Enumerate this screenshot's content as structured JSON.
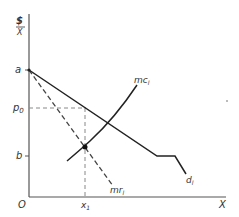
{
  "diagram": {
    "type": "economics-monopoly-pricing",
    "y_axis_label_top": "$",
    "y_axis_label_bottom": "X",
    "x_axis_label": "X",
    "origin_label": "O",
    "y_ticks": [
      {
        "label": "a",
        "y": 70
      },
      {
        "label": "p",
        "sub": "0",
        "y": 108
      },
      {
        "label": "b",
        "y": 156
      }
    ],
    "x_ticks": [
      {
        "label": "x",
        "sub": "1",
        "x": 85
      }
    ],
    "curves": [
      {
        "name": "demand",
        "label": "d",
        "sub": "l",
        "style": "solid"
      },
      {
        "name": "marginal-cost",
        "label": "mc",
        "sub": "l",
        "style": "solid"
      },
      {
        "name": "marginal-revenue",
        "label": "mr",
        "sub": "l",
        "style": "dashed"
      }
    ],
    "guides": [
      {
        "name": "p0-guide",
        "style": "dashed"
      },
      {
        "name": "x1-guide",
        "style": "dashed"
      }
    ],
    "intersection_point": "mc-mr"
  },
  "colors": {
    "line": "#222222",
    "dashed": "#777777",
    "background": "#ffffff"
  }
}
